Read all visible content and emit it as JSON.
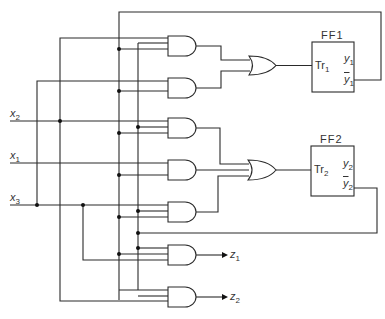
{
  "diagram": {
    "type": "sequential logic circuit",
    "inputs": [
      {
        "name": "x",
        "sub": "2",
        "y": 121
      },
      {
        "name": "x",
        "sub": "1",
        "y": 163
      },
      {
        "name": "x",
        "sub": "3",
        "y": 205
      }
    ],
    "outputs": [
      {
        "name": "z",
        "sub": "1"
      },
      {
        "name": "z",
        "sub": "2"
      }
    ],
    "flip_flops": [
      {
        "title": "FF1",
        "trigger": "Tr",
        "trigger_sub": "1",
        "q": "y",
        "q_sub": "1",
        "qbar": "y",
        "qbar_sub": "1"
      },
      {
        "title": "FF2",
        "trigger": "Tr",
        "trigger_sub": "2",
        "q": "y",
        "q_sub": "2",
        "qbar": "y",
        "qbar_sub": "2"
      }
    ],
    "gates": {
      "and_count": 7,
      "or_count": 2
    },
    "colors": {
      "line": "#2a2a2a",
      "background": "#ffffff",
      "text": "#333333"
    }
  }
}
